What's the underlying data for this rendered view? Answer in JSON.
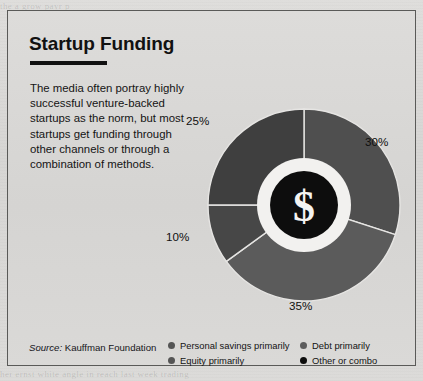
{
  "page": {
    "background_color": "#d9d9d7",
    "bleed_top_text": "the  a  grow  payr  p",
    "bleed_bottom_text": "her  ernst  white  angle  in  reach  last  week  trading"
  },
  "panel": {
    "title": "Startup Funding",
    "body_text": "The media often portray highly successful venture-backed startups as the norm, but most startups get funding through other channels or through a combination of methods.",
    "source_label": "Source:",
    "source_name": "Kauffman Foundation",
    "border_color": "#5a5a58"
  },
  "chart_data": {
    "type": "pie",
    "variant": "donut",
    "title": "Startup Funding",
    "xlabel": "",
    "ylabel": "",
    "center_glyph": "$",
    "center_circle_color": "#0d0d0d",
    "center_ring_color": "#f2f1ef",
    "categories": [
      "Personal savings primarily",
      "Debt primarily",
      "Equity primarily",
      "Other or combo"
    ],
    "values": [
      30,
      35,
      10,
      25
    ],
    "labels": [
      "30%",
      "35%",
      "10%",
      "25%"
    ],
    "colors": [
      "#4f4f4f",
      "#5b5b5b",
      "#474747",
      "#3f3f3f"
    ],
    "slice_order_from_top_clockwise": [
      {
        "label": "30%",
        "value": 30,
        "name": "Personal savings primarily",
        "color": "#4f4f4f"
      },
      {
        "label": "35%",
        "value": 35,
        "name": "Debt primarily",
        "color": "#5b5b5b"
      },
      {
        "label": "10%",
        "value": 10,
        "name": "Equity primarily",
        "color": "#474747"
      },
      {
        "label": "25%",
        "value": 25,
        "name": "Other or combo",
        "color": "#3f3f3f"
      }
    ],
    "legend_position": "bottom",
    "grid": false
  },
  "percent_labels": {
    "top_left": "25%",
    "right": "30%",
    "bottom": "35%",
    "left": "10%"
  },
  "legend": {
    "left_column": [
      {
        "label": "Personal savings primarily",
        "color": "#555555"
      },
      {
        "label": "Equity primarily",
        "color": "#555555"
      }
    ],
    "right_column": [
      {
        "label": "Debt primarily",
        "color": "#5d5d5d"
      },
      {
        "label": "Other or combo",
        "color": "#0d0d0d"
      }
    ]
  }
}
